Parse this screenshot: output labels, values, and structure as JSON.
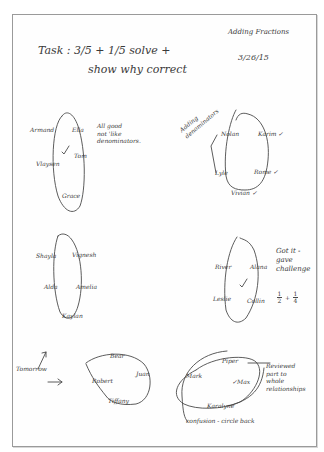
{
  "header": {
    "topic": "Adding Fractions",
    "date": "3/26/15",
    "task_line1": "Task :  3/5 + 1/5  solve +",
    "task_line2": "show why correct"
  },
  "groups": [
    {
      "id": "group-1",
      "names": [
        "Armand",
        "Ella",
        "Vlaysen",
        "Tom",
        "Grace"
      ],
      "check": "✓",
      "note": "All good\nnot 'like\ndenominators."
    },
    {
      "id": "group-2",
      "names": [
        "Nolan",
        "Karim ✓",
        "Lyle",
        "Rome ✓",
        "Vivian ✓"
      ],
      "note": "Adding\ndenominators"
    },
    {
      "id": "group-3",
      "names": [
        "Shayla",
        "Vignesh",
        "Alda",
        "Amelia",
        "Kaylan"
      ]
    },
    {
      "id": "group-4",
      "names": [
        "River",
        "Alana",
        "Leslie",
        "Collin"
      ],
      "check": "✓",
      "note": "Got it -\ngave\nchallenge",
      "challenge": {
        "a_num": "1",
        "a_den": "2",
        "op": "+",
        "b_num": "1",
        "b_den": "4"
      }
    },
    {
      "id": "group-5",
      "label": "Tomorrow",
      "names": [
        "Bear",
        "Robert",
        "Juan",
        "Tiffany"
      ]
    },
    {
      "id": "group-6",
      "names": [
        "Piper",
        "Mark",
        "✓Max",
        "Karalyne"
      ],
      "note": "Reviewed\npart to\nwhole\nrelationships",
      "footer": "confusion - circle back"
    }
  ]
}
